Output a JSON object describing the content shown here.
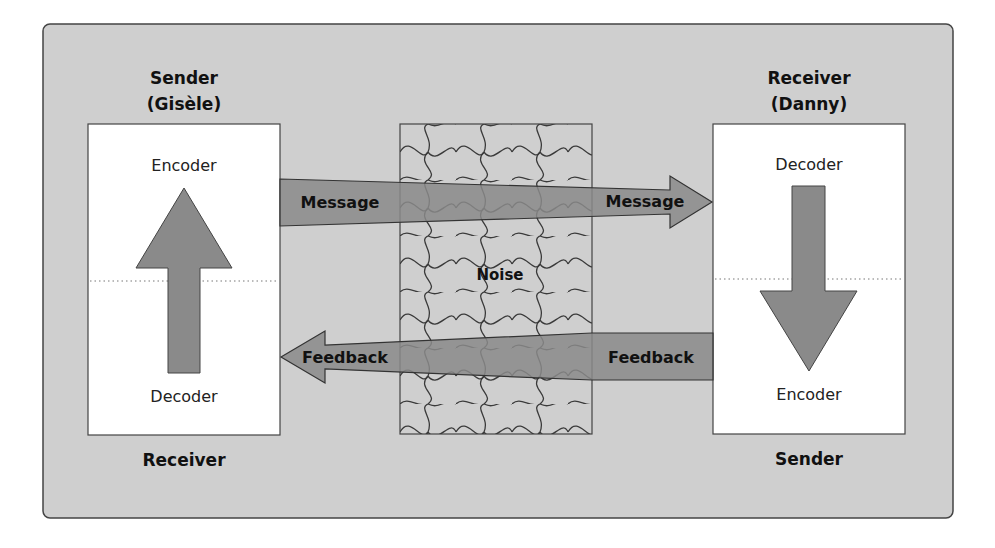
{
  "diagram": {
    "type": "communication-process-model",
    "colors": {
      "panel_bg": "#cfcfcf",
      "box_bg": "#ffffff",
      "arrow_fill": "#8a8a8a",
      "stroke": "#333333",
      "noise_line": "#3a3a3a"
    },
    "left_party": {
      "title_line1": "Sender",
      "title_line2": "(Gisèle)",
      "top_label": "Encoder",
      "bottom_label": "Decoder",
      "footer": "Receiver",
      "arrow_direction": "up"
    },
    "right_party": {
      "title_line1": "Receiver",
      "title_line2": "(Danny)",
      "top_label": "Decoder",
      "bottom_label": "Encoder",
      "footer": "Sender",
      "arrow_direction": "down"
    },
    "channel": {
      "noise_label": "Noise",
      "message_left_label": "Message",
      "message_right_label": "Message",
      "feedback_left_label": "Feedback",
      "feedback_right_label": "Feedback"
    }
  }
}
